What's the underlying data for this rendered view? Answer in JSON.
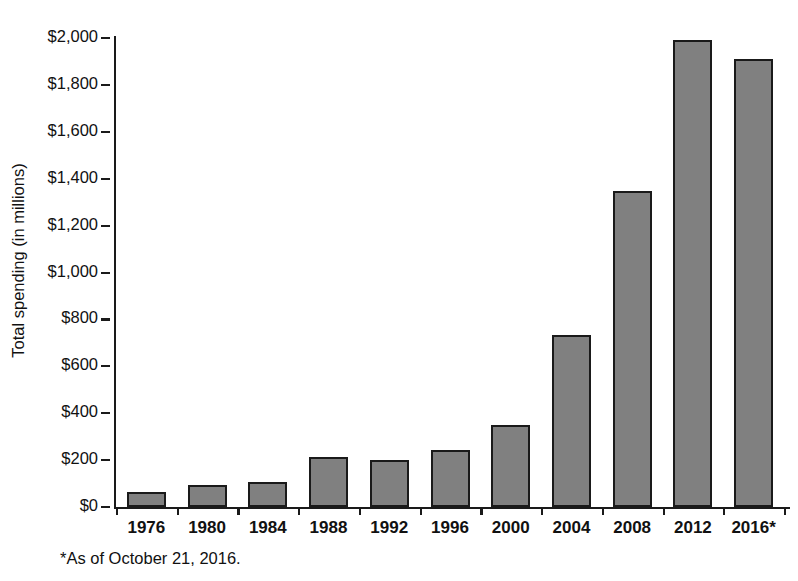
{
  "chart_data": {
    "type": "bar",
    "title": "",
    "xlabel": "",
    "ylabel": "Total spending (in millions)",
    "categories": [
      "1976",
      "1980",
      "1984",
      "1988",
      "1992",
      "1996",
      "2000",
      "2004",
      "2008",
      "2012",
      "2016*"
    ],
    "values": [
      64,
      94,
      107,
      215,
      200,
      245,
      350,
      733,
      1347,
      1990,
      1910
    ],
    "ylim": [
      0,
      2000
    ],
    "ytick_values": [
      0,
      200,
      400,
      600,
      800,
      1000,
      1200,
      1400,
      1600,
      1800,
      2000
    ],
    "ytick_labels": [
      "$0",
      "$200",
      "$400",
      "$600",
      "$800",
      "$1,000",
      "$1,200",
      "$1,400",
      "$1,600",
      "$1,800",
      "$2,000"
    ],
    "grid": false,
    "legend": null,
    "bar_color": "#808080",
    "bar_edge_color": "#1a1a1a",
    "annotations": [
      "*As of October 21, 2016."
    ]
  },
  "footnote": "*As of October 21, 2016.",
  "title_sliver": ""
}
